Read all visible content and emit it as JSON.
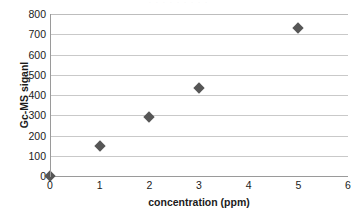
{
  "chart_data": {
    "type": "scatter",
    "title": "",
    "xlabel": "concentration (ppm)",
    "ylabel": "Gc-MS siganl",
    "x": [
      0,
      1,
      2,
      3,
      5
    ],
    "values": [
      0,
      150,
      290,
      435,
      733
    ],
    "points": [
      {
        "x": 0,
        "y": 0
      },
      {
        "x": 1,
        "y": 150
      },
      {
        "x": 2,
        "y": 290
      },
      {
        "x": 3,
        "y": 435
      },
      {
        "x": 5,
        "y": 733
      }
    ],
    "xlim": [
      0,
      6
    ],
    "ylim": [
      0,
      800
    ],
    "xticks": [
      "0",
      "1",
      "2",
      "3",
      "4",
      "5",
      "6"
    ],
    "yticks": [
      "0",
      "100",
      "200",
      "300",
      "400",
      "500",
      "600",
      "700",
      "800"
    ],
    "xtick_values": [
      0,
      1,
      2,
      3,
      4,
      5,
      6
    ],
    "ytick_values": [
      0,
      100,
      200,
      300,
      400,
      500,
      600,
      700,
      800
    ],
    "grid": "horizontal",
    "legend": "none",
    "marker": "diamond",
    "marker_color": "#565656",
    "gridline_color": "#c9c9c9",
    "axis_color": "#9a9a9a",
    "text_color": "#1b1b1b",
    "background": "#ffffff"
  },
  "title_remnant": "· · · · · · · · ·"
}
